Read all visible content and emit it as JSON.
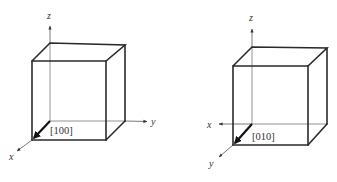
{
  "figures": [
    {
      "id": "cube-100",
      "axes": {
        "x": "x",
        "y": "y",
        "z": "z"
      },
      "direction_label": "[100]",
      "direction_axis": "x"
    },
    {
      "id": "cube-010",
      "axes": {
        "x": "x",
        "y": "y",
        "z": "z"
      },
      "direction_label": "[010]",
      "direction_axis": "y"
    }
  ],
  "colors": {
    "edge": "#2a2a2a",
    "axis": "#555555",
    "text": "#333333",
    "background": "#ffffff"
  }
}
